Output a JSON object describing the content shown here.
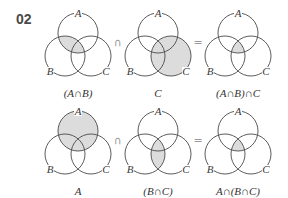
{
  "problem_number": "02",
  "shade_color": "#dcdcdc",
  "rows": [
    {
      "diagrams": [
        {
          "caption": "(A∩B)",
          "shaded_region": "A∩B",
          "labels": {
            "a": "A",
            "b": "B",
            "c": "C"
          }
        },
        {
          "caption": "C",
          "shaded_region": "C",
          "labels": {
            "a": "A",
            "b": "B",
            "c": "C"
          }
        },
        {
          "caption": "(A∩B)∩C",
          "shaded_region": "A∩B∩C",
          "labels": {
            "a": "A",
            "b": "B",
            "c": "C"
          }
        }
      ],
      "operators": [
        "∩",
        "="
      ]
    },
    {
      "diagrams": [
        {
          "caption": "A",
          "shaded_region": "A",
          "labels": {
            "a": "A",
            "b": "B",
            "c": "C"
          }
        },
        {
          "caption": "(B∩C)",
          "shaded_region": "B∩C",
          "labels": {
            "a": "A",
            "b": "B",
            "c": "C"
          }
        },
        {
          "caption": "A∩(B∩C)",
          "shaded_region": "A∩B∩C",
          "labels": {
            "a": "A",
            "b": "B",
            "c": "C"
          }
        }
      ],
      "operators": [
        "∩",
        "="
      ]
    }
  ]
}
